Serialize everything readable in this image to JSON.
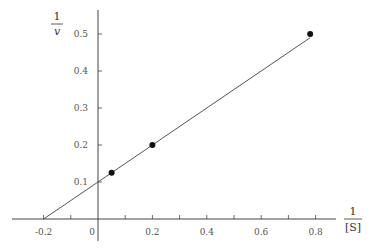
{
  "chart_data": {
    "type": "line",
    "title": "",
    "xlabel": {
      "numerator": "1",
      "denominator": "[S]"
    },
    "ylabel": {
      "numerator": "1",
      "denominator": "v"
    },
    "xlim": [
      -0.2,
      0.85
    ],
    "ylim": [
      0,
      0.55
    ],
    "grid": false,
    "legend": null,
    "x_ticks": [
      -0.2,
      -0.1,
      0,
      0.1,
      0.2,
      0.3,
      0.4,
      0.5,
      0.6,
      0.7,
      0.8
    ],
    "x_tick_labels": [
      {
        "value": -0.2,
        "label": "-0.2"
      },
      {
        "value": 0,
        "label": "0"
      },
      {
        "value": 0.2,
        "label": "0.2"
      },
      {
        "value": 0.4,
        "label": "0.4"
      },
      {
        "value": 0.6,
        "label": "0.6"
      },
      {
        "value": 0.8,
        "label": "0.8"
      }
    ],
    "y_ticks": [
      0.1,
      0.2,
      0.3,
      0.4,
      0.5
    ],
    "y_tick_labels": [
      {
        "value": 0.1,
        "label": "0.1"
      },
      {
        "value": 0.2,
        "label": "0.2"
      },
      {
        "value": 0.3,
        "label": "0.3"
      },
      {
        "value": 0.4,
        "label": "0.4"
      },
      {
        "value": 0.5,
        "label": "0.5"
      }
    ],
    "series": [
      {
        "name": "fit line",
        "kind": "line",
        "x": [
          -0.2,
          0.78
        ],
        "y": [
          0.0,
          0.49
        ]
      },
      {
        "name": "data points",
        "kind": "scatter",
        "x": [
          0.05,
          0.2,
          0.78
        ],
        "y": [
          0.125,
          0.2,
          0.5
        ]
      }
    ],
    "annotations": {
      "y_intercept": 0.1,
      "x_intercept": -0.2
    }
  },
  "style": {
    "axis_color": "#444444",
    "line_color": "#555555",
    "point_color": "#111111"
  }
}
